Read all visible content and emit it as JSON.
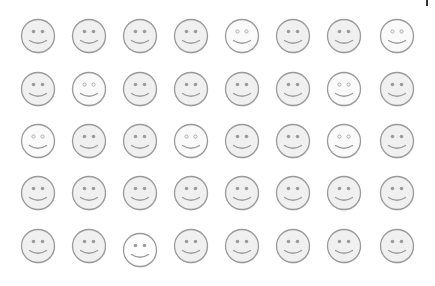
{
  "grid": {
    "rows": 5,
    "cols": 8,
    "col_centers": [
      38,
      89,
      140,
      191,
      242,
      293,
      344,
      397
    ],
    "row_centers": [
      36,
      89,
      141,
      193,
      246
    ],
    "colors": {
      "outline": "#9a9a9a",
      "fill_filled": "#f0f0f0",
      "fill_hollow": "#fafafa",
      "eye_filled": "#9c9c9c",
      "eye_hollow_ring": "#a8a8a8",
      "mouth": "#9a9a9a",
      "shadow": "#c8c8c8"
    },
    "faces": [
      [
        "filled",
        "filled",
        "filled",
        "filled",
        "hollow",
        "filled",
        "filled",
        "hollow"
      ],
      [
        "filled",
        "hollow",
        "filled",
        "filled",
        "filled",
        "filled",
        "hollow",
        "filled"
      ],
      [
        "hollow",
        "filled",
        "filled",
        "hollow",
        "filled",
        "filled",
        "hollow",
        "filled"
      ],
      [
        "filled",
        "filled",
        "filled",
        "filled",
        "filled",
        "filled",
        "filled",
        "filled"
      ],
      [
        "filled",
        "filled",
        "white-offset",
        "filled",
        "filled",
        "filled",
        "filled",
        "filled"
      ]
    ],
    "icon": "smiley-face-icon"
  },
  "marker": {
    "icon": "text-caret-icon"
  }
}
